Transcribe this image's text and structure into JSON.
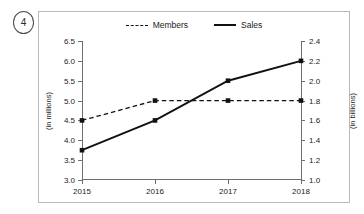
{
  "item_number": "4",
  "legend": {
    "position": "top-center",
    "entries": [
      {
        "label": "Members",
        "style": "dashed",
        "color": "#111111"
      },
      {
        "label": "Sales",
        "style": "solid",
        "color": "#111111"
      }
    ]
  },
  "chart_data": {
    "type": "line",
    "title": "",
    "xlabel": "",
    "categories": [
      "2015",
      "2016",
      "2017",
      "2018"
    ],
    "grid": false,
    "axes": {
      "left": {
        "label": "(in millions)",
        "min": 3.0,
        "max": 6.5,
        "step": 0.5,
        "ticks": [
          "3.0",
          "3.5",
          "4.0",
          "4.5",
          "5.0",
          "5.5",
          "6.0",
          "6.5"
        ]
      },
      "right": {
        "label": "(in billions)",
        "min": 1.0,
        "max": 2.4,
        "step": 0.2,
        "ticks": [
          "1.0",
          "1.2",
          "1.4",
          "1.6",
          "1.8",
          "2.0",
          "2.2",
          "2.4"
        ]
      }
    },
    "series": [
      {
        "name": "Members",
        "axis": "left",
        "style": "dashed",
        "color": "#111111",
        "marker": "square",
        "values": [
          4.5,
          5.0,
          5.0,
          5.0
        ],
        "unit": "millions"
      },
      {
        "name": "Sales",
        "axis": "right",
        "style": "solid",
        "color": "#111111",
        "marker": "square",
        "values": [
          1.3,
          1.6,
          2.0,
          2.2
        ],
        "unit": "billions"
      }
    ]
  }
}
